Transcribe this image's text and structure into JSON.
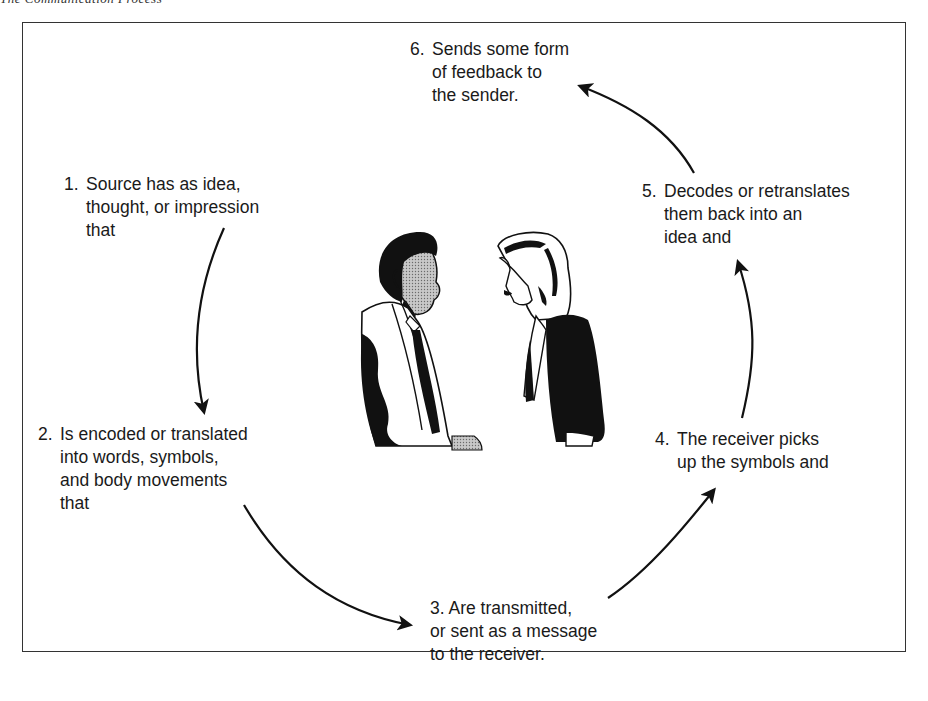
{
  "caption": "The Communication Process",
  "diagram": {
    "type": "cycle",
    "steps": [
      {
        "number": "1.",
        "lines": [
          "Source has as idea,",
          "thought, or impression",
          "that"
        ]
      },
      {
        "number": "2.",
        "lines": [
          "Is encoded or translated",
          "into words, symbols,",
          "and body movements",
          "that"
        ]
      },
      {
        "number": "3.",
        "lines": [
          "Are transmitted,",
          "or sent as a message",
          "to the receiver."
        ]
      },
      {
        "number": "4.",
        "lines": [
          "The receiver picks",
          "up the symbols and"
        ]
      },
      {
        "number": "5.",
        "lines": [
          "Decodes or retranslates",
          "them back into an",
          "idea and"
        ]
      },
      {
        "number": "6.",
        "lines": [
          "Sends some form",
          "of feedback to",
          "the sender."
        ]
      }
    ],
    "arrows": [
      {
        "from": "1",
        "to": "2"
      },
      {
        "from": "2",
        "to": "3"
      },
      {
        "from": "3",
        "to": "4"
      },
      {
        "from": "4",
        "to": "5"
      },
      {
        "from": "5",
        "to": "6"
      }
    ],
    "illustration": "man-and-woman-conversing"
  }
}
